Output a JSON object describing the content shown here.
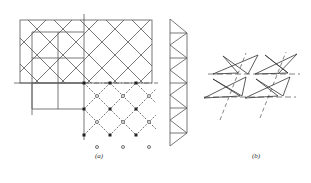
{
  "figure": {
    "panels": [
      {
        "id": "a",
        "label": "(a)"
      },
      {
        "id": "b",
        "label": "(b)"
      }
    ],
    "colors": {
      "line": "#555555",
      "node": "#222222",
      "background": "#ffffff"
    }
  }
}
